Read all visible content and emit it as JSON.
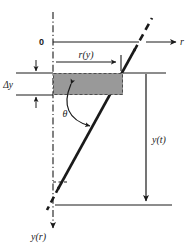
{
  "figure": {
    "background_color": "#ffffff",
    "line_color": "#1a1a1a",
    "fill_color": "#999999",
    "dash_border_color": "#555555"
  },
  "labels": {
    "origin": "0",
    "radial_axis": "r",
    "vertical_axis": "y(r)",
    "radius_of_y": "r(y)",
    "delta_y": "Δy",
    "angle": "θ",
    "y_of_t": "y(t)"
  },
  "geometry": {
    "vertical_axis_x": 53,
    "origin_y": 42,
    "slab_top_y": 73,
    "slab_bottom_y": 95,
    "slab_left_x": 53,
    "slab_right_x": 123,
    "bottom_line_y": 205,
    "ytick_x": 146,
    "diagonal_top_x": 150,
    "diagonal_top_y": 22,
    "diagonal_bottom_x": 48,
    "diagonal_bottom_y": 208
  },
  "elements": {
    "slab_fill": "shaded rectangular control volume",
    "diagonal": "inclined interface line",
    "diagonal_dashed_upper": "dashed extension above r-axis",
    "diagonal_dashed_lower": "dashed extension below",
    "angle_arc": "double headed arc from slab to inclined line",
    "r_axis_arrow": "arrow pointing right",
    "y_axis_arrow": "arrow pointing down",
    "ry_dimension_arrow": "arrow pointing right to interface",
    "yt_dimension_arrow": "arrow pointing down to bottom line",
    "delta_y_arrows": "inward pointing dimension arrows"
  }
}
